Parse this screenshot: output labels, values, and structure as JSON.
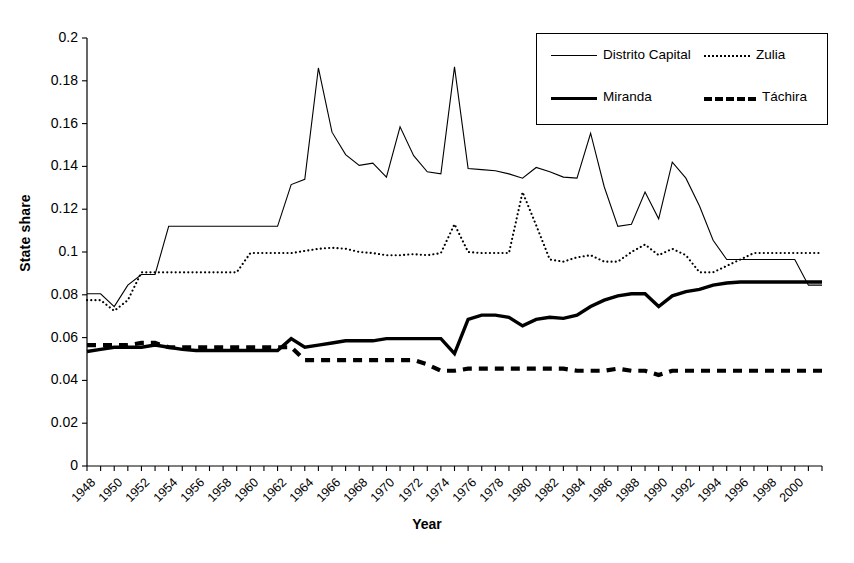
{
  "chart_data": {
    "type": "line",
    "title": "",
    "xlabel": "Year",
    "ylabel": "State share",
    "xlim": [
      1948,
      2002
    ],
    "ylim": [
      0,
      0.2
    ],
    "ytick_values": [
      0,
      0.02,
      0.04,
      0.06,
      0.08,
      0.1,
      0.12,
      0.14,
      0.16,
      0.18,
      0.2
    ],
    "ytick_labels": [
      "0",
      "0.02",
      "0.04",
      "0.06",
      "0.08",
      "0.1",
      "0.12",
      "0.14",
      "0.16",
      "0.18",
      "0.2"
    ],
    "xtick_labels": [
      "1948",
      "1950",
      "1952",
      "1954",
      "1956",
      "1958",
      "1960",
      "1962",
      "1964",
      "1966",
      "1968",
      "1970",
      "1972",
      "1974",
      "1976",
      "1978",
      "1980",
      "1982",
      "1984",
      "1986",
      "1988",
      "1990",
      "1992",
      "1994",
      "1996",
      "1998",
      "2000"
    ],
    "xtick_step": 2,
    "minor_tick_step": 1,
    "grid": false,
    "legend_position": "top-right",
    "x": [
      1948,
      1949,
      1950,
      1951,
      1952,
      1953,
      1954,
      1955,
      1956,
      1957,
      1958,
      1959,
      1960,
      1961,
      1962,
      1963,
      1964,
      1965,
      1966,
      1967,
      1968,
      1969,
      1970,
      1971,
      1972,
      1973,
      1974,
      1975,
      1976,
      1977,
      1978,
      1979,
      1980,
      1981,
      1982,
      1983,
      1984,
      1985,
      1986,
      1987,
      1988,
      1989,
      1990,
      1991,
      1992,
      1993,
      1994,
      1995,
      1996,
      1997,
      1998,
      1999,
      2000,
      2001,
      2002
    ],
    "series": [
      {
        "name": "Distrito Capital",
        "style": "thin-solid",
        "color": "#000000",
        "values": [
          0.0805,
          0.0805,
          0.0745,
          0.0845,
          0.0895,
          0.0895,
          0.112,
          0.112,
          0.112,
          0.112,
          0.112,
          0.112,
          0.112,
          0.112,
          0.112,
          0.1315,
          0.134,
          0.186,
          0.156,
          0.1455,
          0.1405,
          0.1415,
          0.135,
          0.1585,
          0.145,
          0.1375,
          0.1365,
          0.1865,
          0.139,
          0.1385,
          0.138,
          0.1365,
          0.1345,
          0.1395,
          0.1375,
          0.135,
          0.1345,
          0.1555,
          0.1305,
          0.112,
          0.113,
          0.128,
          0.1155,
          0.142,
          0.1345,
          0.1215,
          0.1055,
          0.0965,
          0.0965,
          0.0965,
          0.0965,
          0.0965,
          0.0965,
          0.0845,
          0.0845
        ]
      },
      {
        "name": "Zulia",
        "style": "dotted",
        "color": "#000000",
        "values": [
          0.0775,
          0.0775,
          0.0725,
          0.0775,
          0.0905,
          0.0905,
          0.0905,
          0.0905,
          0.0905,
          0.0905,
          0.0905,
          0.0905,
          0.0995,
          0.0995,
          0.0995,
          0.0995,
          0.1005,
          0.1015,
          0.102,
          0.1015,
          0.1,
          0.0995,
          0.0985,
          0.0985,
          0.099,
          0.0985,
          0.0995,
          0.113,
          0.1,
          0.0995,
          0.0995,
          0.0995,
          0.128,
          0.1125,
          0.0965,
          0.0955,
          0.0975,
          0.0985,
          0.0955,
          0.0955,
          0.1,
          0.1035,
          0.0985,
          0.1015,
          0.0985,
          0.0905,
          0.0905,
          0.0935,
          0.0965,
          0.0995,
          0.0995,
          0.0995,
          0.0995,
          0.0995,
          0.0995
        ]
      },
      {
        "name": "Miranda",
        "style": "thick-solid",
        "color": "#000000",
        "values": [
          0.0535,
          0.0545,
          0.0555,
          0.0555,
          0.0555,
          0.0565,
          0.0555,
          0.0545,
          0.054,
          0.054,
          0.054,
          0.054,
          0.054,
          0.054,
          0.054,
          0.0595,
          0.0555,
          0.0565,
          0.0575,
          0.0585,
          0.0585,
          0.0585,
          0.0595,
          0.0595,
          0.0595,
          0.0595,
          0.0595,
          0.0525,
          0.0685,
          0.0705,
          0.0705,
          0.0695,
          0.0655,
          0.0685,
          0.0695,
          0.069,
          0.0705,
          0.0745,
          0.0775,
          0.0795,
          0.0805,
          0.0805,
          0.0745,
          0.0795,
          0.0815,
          0.0825,
          0.0845,
          0.0855,
          0.086,
          0.086,
          0.086,
          0.086,
          0.086,
          0.086,
          0.086
        ]
      },
      {
        "name": "Táchira",
        "style": "thick-dashed",
        "color": "#000000",
        "values": [
          0.0565,
          0.0565,
          0.0565,
          0.0565,
          0.0575,
          0.0575,
          0.0555,
          0.0555,
          0.0555,
          0.0555,
          0.0555,
          0.0555,
          0.0555,
          0.0555,
          0.0555,
          0.0555,
          0.0495,
          0.0495,
          0.0495,
          0.0495,
          0.0495,
          0.0495,
          0.0495,
          0.0495,
          0.0495,
          0.0475,
          0.0445,
          0.0445,
          0.0455,
          0.0455,
          0.0455,
          0.0455,
          0.0455,
          0.0455,
          0.0455,
          0.0455,
          0.0445,
          0.0445,
          0.0445,
          0.0455,
          0.0445,
          0.0445,
          0.0425,
          0.0445,
          0.0445,
          0.0445,
          0.0445,
          0.0445,
          0.0445,
          0.0445,
          0.0445,
          0.0445,
          0.0445,
          0.0445,
          0.0445
        ]
      }
    ]
  },
  "legend": {
    "entries": [
      {
        "label": "Distrito Capital",
        "style": "thin-solid"
      },
      {
        "label": "Zulia",
        "style": "dotted"
      },
      {
        "label": "Miranda",
        "style": "thick-solid"
      },
      {
        "label": "Táchira",
        "style": "thick-dashed"
      }
    ]
  },
  "axes": {
    "x_title": "Year",
    "y_title": "State share"
  }
}
